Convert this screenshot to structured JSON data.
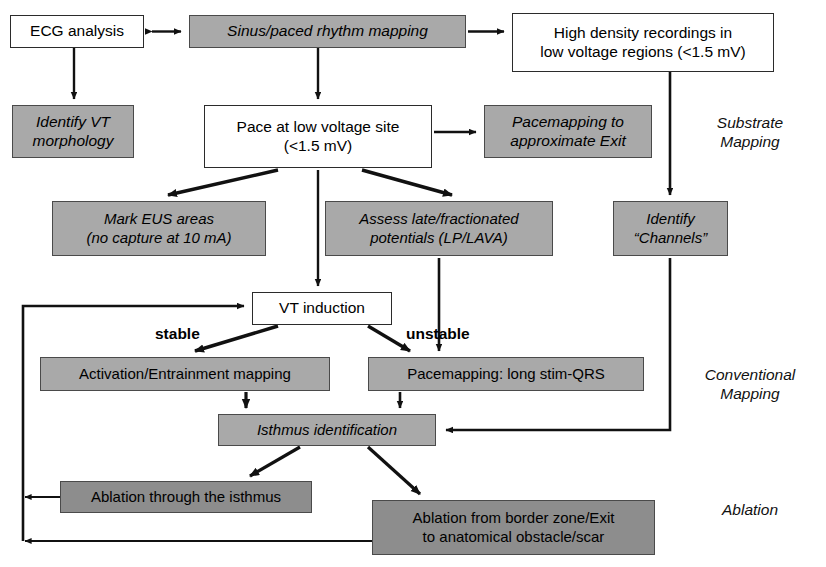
{
  "diagram": {
    "colors": {
      "white_box_fill": "#ffffff",
      "gray_box_fill": "#a9a9a9",
      "dark_gray_box_fill": "#8d8d8d",
      "border": "#2b2b2b",
      "line": "#111111",
      "text": "#000000"
    },
    "nodes": [
      {
        "id": "ecg_analysis",
        "label": "ECG analysis",
        "style": "white",
        "italic": false,
        "x": 10,
        "y": 15,
        "w": 134,
        "h": 33,
        "fs": 15.5
      },
      {
        "id": "sinus_paced_rhythm_mapping",
        "label": "Sinus/paced rhythm mapping",
        "style": "gray",
        "italic": true,
        "x": 189,
        "y": 15,
        "w": 277,
        "h": 33,
        "fs": 15.5
      },
      {
        "id": "high_density_recordings",
        "label": "High density recordings in\nlow voltage regions (<1.5 mV)",
        "style": "white",
        "italic": false,
        "x": 512,
        "y": 13,
        "w": 262,
        "h": 59,
        "fs": 15.5
      },
      {
        "id": "identify_vt_morphology",
        "label": "Identify VT\nmorphology",
        "style": "gray",
        "italic": true,
        "x": 12,
        "y": 105,
        "w": 122,
        "h": 53,
        "fs": 15.5
      },
      {
        "id": "pace_at_low_voltage_site",
        "label": "Pace at low voltage site\n(<1.5 mV)",
        "style": "white",
        "italic": false,
        "x": 204,
        "y": 105,
        "w": 228,
        "h": 63,
        "fs": 15.5
      },
      {
        "id": "pacemapping_approximate_exit",
        "label": "Pacemapping to\napproximate Exit",
        "style": "gray",
        "italic": true,
        "x": 484,
        "y": 105,
        "w": 168,
        "h": 53,
        "fs": 15.5
      },
      {
        "id": "mark_eus_areas",
        "label": "Mark EUS areas\n(no capture at 10 mA)",
        "style": "gray",
        "italic": true,
        "x": 52,
        "y": 201,
        "w": 214,
        "h": 55,
        "fs": 15
      },
      {
        "id": "assess_late_fractionated_potentials",
        "label": "Assess late/fractionated\npotentials (LP/LAVA)",
        "style": "gray",
        "italic": true,
        "x": 325,
        "y": 201,
        "w": 228,
        "h": 55,
        "fs": 15
      },
      {
        "id": "identify_channels",
        "label": "Identify\n“Channels”",
        "style": "gray",
        "italic": true,
        "x": 613,
        "y": 201,
        "w": 115,
        "h": 55,
        "fs": 15
      },
      {
        "id": "vt_induction",
        "label": "VT induction",
        "style": "white",
        "italic": false,
        "x": 252,
        "y": 292,
        "w": 140,
        "h": 33,
        "fs": 15.5
      },
      {
        "id": "activation_entrainment_mapping",
        "label": "Activation/Entrainment mapping",
        "style": "gray",
        "italic": false,
        "x": 40,
        "y": 357,
        "w": 290,
        "h": 34,
        "fs": 15
      },
      {
        "id": "pacemapping_long_stim_qrs",
        "label": "Pacemapping: long stim-QRS",
        "style": "gray",
        "italic": false,
        "x": 368,
        "y": 357,
        "w": 276,
        "h": 34,
        "fs": 15
      },
      {
        "id": "isthmus_identification",
        "label": "Isthmus identification",
        "style": "gray",
        "italic": true,
        "x": 218,
        "y": 414,
        "w": 218,
        "h": 32,
        "fs": 15
      },
      {
        "id": "ablation_through_isthmus",
        "label": "Ablation through the isthmus",
        "style": "darkgray",
        "italic": false,
        "x": 60,
        "y": 481,
        "w": 252,
        "h": 32,
        "fs": 15
      },
      {
        "id": "ablation_from_border_zone",
        "label": "Ablation from border zone/Exit\nto anatomical obstacle/scar",
        "style": "darkgray",
        "italic": false,
        "x": 372,
        "y": 500,
        "w": 283,
        "h": 55,
        "fs": 15
      }
    ],
    "edge_labels": [
      {
        "id": "stable",
        "text": "stable",
        "x": 155,
        "y": 325,
        "fs": 15.5
      },
      {
        "id": "unstable",
        "text": "unstable",
        "x": 406,
        "y": 325,
        "fs": 15.5
      }
    ],
    "phase_labels": [
      {
        "id": "substrate_mapping",
        "text": "Substrate\nMapping",
        "x": 690,
        "y": 113,
        "w": 120,
        "fs": 15.5
      },
      {
        "id": "conventional_mapping",
        "text": "Conventional\nMapping",
        "x": 680,
        "y": 365,
        "w": 140,
        "fs": 15.5
      },
      {
        "id": "ablation",
        "text": "Ablation",
        "x": 690,
        "y": 500,
        "w": 120,
        "fs": 15.5
      }
    ]
  }
}
